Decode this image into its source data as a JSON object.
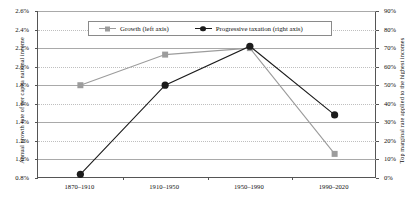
{
  "chart_data": {
    "type": "line",
    "title": "",
    "categories": [
      "1870–1910",
      "1910–1950",
      "1950–1990",
      "1990–2020"
    ],
    "series": [
      {
        "name": "Growth (left axis)",
        "axis": "left",
        "marker": "square",
        "color": "#9c9c9c",
        "values": [
          1.8,
          2.13,
          2.2,
          1.06
        ],
        "value_labels": [
          "1.8%",
          "2.13%",
          "2.2%",
          "1.06%"
        ]
      },
      {
        "name": "Progressive taxation (right axis)",
        "axis": "right",
        "marker": "circle",
        "color": "#1c1c1c",
        "values": [
          2,
          50,
          71,
          34
        ],
        "value_labels": [
          "2%",
          "50%",
          "71%",
          "34%"
        ]
      }
    ],
    "left_axis": {
      "label": "Annual growth rate of per capita national income",
      "ticks": [
        "0.8%",
        "1.0%",
        "1.2%",
        "1.4%",
        "1.6%",
        "1.8%",
        "2.0%",
        "2.2%",
        "2.4%",
        "2.6%"
      ],
      "tick_values": [
        0.8,
        1.0,
        1.2,
        1.4,
        1.6,
        1.8,
        2.0,
        2.2,
        2.4,
        2.6
      ],
      "ylim": [
        0.8,
        2.6
      ]
    },
    "right_axis": {
      "label": "Top marginal rate applied to the highest incomes",
      "ticks": [
        "0%",
        "10%",
        "20%",
        "30%",
        "40%",
        "50%",
        "60%",
        "70%",
        "80%",
        "90%"
      ],
      "tick_values": [
        0,
        10,
        20,
        30,
        40,
        50,
        60,
        70,
        80,
        90
      ],
      "ylim": [
        0,
        90
      ]
    },
    "xlabel": "",
    "grid": true,
    "legend_position": "top-center",
    "legend": [
      "Growth (left axis)",
      "Progressive taxation (right axis)"
    ]
  }
}
